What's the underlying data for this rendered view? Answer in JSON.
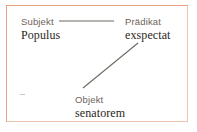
{
  "diagram": {
    "frame_color": "#e4a383",
    "role_text_color": "#6d6259",
    "word_text_color": "#2c2721",
    "line_color": "#6f6a63",
    "background": "#ffffff",
    "nodes": [
      {
        "id": "subject",
        "role": "Subjekt",
        "word": "Populus"
      },
      {
        "id": "predicate",
        "role": "Prädikat",
        "word": "exspectat"
      },
      {
        "id": "object",
        "role": "Objekt",
        "word": "senatorem"
      }
    ],
    "connectors": [
      {
        "id": "subject-predicate",
        "from": "subject",
        "to": "predicate",
        "x1": 58,
        "y1": 20,
        "x2": 113,
        "y2": 20
      },
      {
        "id": "predicate-object",
        "from": "predicate",
        "to": "object",
        "x1": 137,
        "y1": 42,
        "x2": 82,
        "y2": 87
      }
    ],
    "artifact": {
      "id": "margin-dash",
      "label": "-"
    }
  }
}
